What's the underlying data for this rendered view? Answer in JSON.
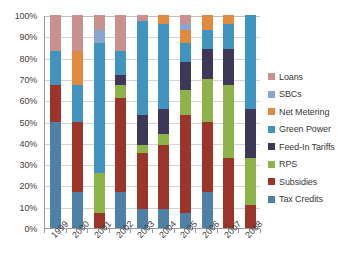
{
  "chart_data": {
    "type": "bar",
    "subtype": "stacked-percentage",
    "title": "",
    "xlabel": "",
    "ylabel": "",
    "ylim": [
      0,
      100
    ],
    "y_tick_labels": [
      "0%",
      "10%",
      "20%",
      "30%",
      "40%",
      "50%",
      "60%",
      "70%",
      "80%",
      "90%",
      "100%"
    ],
    "y_tick_values": [
      0,
      10,
      20,
      30,
      40,
      50,
      60,
      70,
      80,
      90,
      100
    ],
    "grid": true,
    "legend_position": "right",
    "categories": [
      "1999",
      "2000",
      "2001",
      "2002",
      "2003",
      "2004",
      "2005",
      "2006",
      "2007",
      "2008"
    ],
    "series": [
      {
        "name": "Tax Credits",
        "color": "#4f81a8",
        "values": [
          50,
          17,
          0,
          17,
          9,
          9,
          7,
          17,
          0,
          0
        ]
      },
      {
        "name": "Subsidies",
        "color": "#9b3429",
        "values": [
          17,
          33,
          7,
          44,
          26,
          30,
          46,
          33,
          33,
          11
        ]
      },
      {
        "name": "RPS",
        "color": "#8cb44a",
        "values": [
          0,
          0,
          19,
          6,
          4,
          5,
          12,
          20,
          34,
          22
        ]
      },
      {
        "name": "Feed-In Tariffs",
        "color": "#3f3757",
        "values": [
          0,
          0,
          0,
          5,
          14,
          12,
          13,
          14,
          17,
          23
        ]
      },
      {
        "name": "Green Power",
        "color": "#4193c0",
        "values": [
          16,
          17,
          61,
          11,
          44,
          40,
          9,
          9,
          12,
          44
        ]
      },
      {
        "name": "Net Metering",
        "color": "#df8a3f",
        "values": [
          0,
          16,
          0,
          0,
          0,
          4,
          6,
          7,
          4,
          0
        ]
      },
      {
        "name": "SBCs",
        "color": "#8aa6cf",
        "values": [
          0,
          0,
          6,
          0,
          0,
          0,
          3,
          0,
          0,
          0
        ]
      },
      {
        "name": "Loans",
        "color": "#c8918d",
        "values": [
          17,
          17,
          7,
          17,
          3,
          0,
          4,
          0,
          0,
          0
        ]
      }
    ],
    "legend_entries": [
      {
        "label": "Loans",
        "color": "#c8918d"
      },
      {
        "label": "SBCs",
        "color": "#8aa6cf"
      },
      {
        "label": "Net Metering",
        "color": "#df8a3f"
      },
      {
        "label": "Green Power",
        "color": "#4193c0"
      },
      {
        "label": "Feed-In Tariffs",
        "color": "#3f3757"
      },
      {
        "label": "RPS",
        "color": "#8cb44a"
      },
      {
        "label": "Subsidies",
        "color": "#9b3429"
      },
      {
        "label": "Tax Credits",
        "color": "#4f81a8"
      }
    ]
  }
}
